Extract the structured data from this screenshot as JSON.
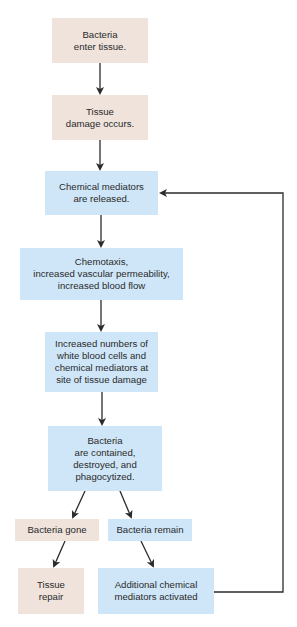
{
  "diagram": {
    "title": "",
    "colors": {
      "tan_box": "#efe3dc",
      "blue_box": "#cfe6f8",
      "arrow": "#2b2b2b",
      "text": "#2a2a2a"
    },
    "nodes": [
      {
        "id": "bacteria-enter",
        "text": "Bacteria\nenter tissue.",
        "color": "tan"
      },
      {
        "id": "tissue-damage",
        "text": "Tissue\ndamage occurs.",
        "color": "tan"
      },
      {
        "id": "mediators-released",
        "text": "Chemical mediators\nare released.",
        "color": "blue"
      },
      {
        "id": "chemotaxis",
        "text": "Chemotaxis,\nincreased vascular permeability,\nincreased blood flow",
        "color": "blue"
      },
      {
        "id": "increased-wbc",
        "text": "Increased numbers of\nwhite blood cells and\nchemical mediators at\nsite of tissue damage",
        "color": "blue"
      },
      {
        "id": "bacteria-contained",
        "text": "Bacteria\nare contained,\ndestroyed, and\nphagocytized.",
        "color": "blue"
      },
      {
        "id": "bacteria-gone",
        "text": "Bacteria gone",
        "color": "tan"
      },
      {
        "id": "bacteria-remain",
        "text": "Bacteria remain",
        "color": "blue"
      },
      {
        "id": "tissue-repair",
        "text": "Tissue\nrepair",
        "color": "tan"
      },
      {
        "id": "additional-mediators",
        "text": "Additional chemical\nmediators activated",
        "color": "blue"
      }
    ],
    "edges": [
      {
        "from": "bacteria-enter",
        "to": "tissue-damage"
      },
      {
        "from": "tissue-damage",
        "to": "mediators-released"
      },
      {
        "from": "mediators-released",
        "to": "chemotaxis"
      },
      {
        "from": "chemotaxis",
        "to": "increased-wbc"
      },
      {
        "from": "increased-wbc",
        "to": "bacteria-contained"
      },
      {
        "from": "bacteria-contained",
        "to": "bacteria-gone"
      },
      {
        "from": "bacteria-contained",
        "to": "bacteria-remain"
      },
      {
        "from": "bacteria-gone",
        "to": "tissue-repair"
      },
      {
        "from": "bacteria-remain",
        "to": "additional-mediators"
      },
      {
        "from": "additional-mediators",
        "to": "mediators-released",
        "type": "feedback-loop"
      }
    ]
  }
}
